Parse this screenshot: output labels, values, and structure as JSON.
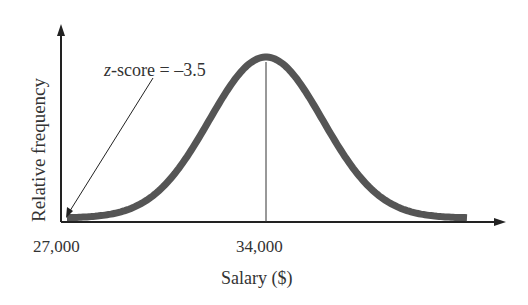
{
  "chart_data": {
    "type": "line",
    "title": "",
    "xlabel": "Salary ($)",
    "ylabel": "Relative frequency",
    "x_tick_labels": [
      "27,000",
      "34,000"
    ],
    "x_ticks": [
      27000,
      34000
    ],
    "mean": 34000,
    "std_dev": 2000,
    "distribution": "normal",
    "annotation": {
      "z_var": "z",
      "text": "-score = –3.5",
      "points_to_x": 27000,
      "z_score": -3.5
    },
    "grid": false,
    "legend": null,
    "curve_color": "#555555",
    "mean_line": true
  },
  "labels": {
    "x_tick_0": "27,000",
    "x_tick_1": "34,000",
    "xlabel": "Salary ($)",
    "ylabel": "Relative frequency",
    "annotation_var": "z",
    "annotation_rest": "-score = –3.5"
  }
}
